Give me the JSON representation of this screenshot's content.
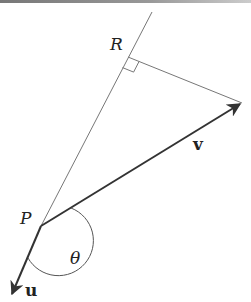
{
  "diagram": {
    "labels": {
      "point_R": "R",
      "point_P": "P",
      "vector_v": "v",
      "vector_u": "u",
      "angle": "θ"
    },
    "colors": {
      "line": "#666666",
      "vector": "#333333",
      "text": "#222222",
      "background": "#ffffff"
    },
    "points": {
      "P": [
        41,
        226
      ],
      "R": [
        128,
        57
      ],
      "line_top": [
        152,
        12
      ],
      "v_tip": [
        242,
        103
      ],
      "u_tip": [
        11,
        296
      ]
    }
  }
}
